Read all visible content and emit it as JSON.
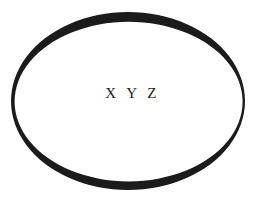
{
  "canvas": {
    "width": 261,
    "height": 207,
    "background_color": "#ffffff"
  },
  "diagram": {
    "shape": {
      "kind": "ellipse",
      "label": "X Y Z",
      "stroke_color": "#1b1b1b",
      "fill_color": "#ffffff",
      "center_x": 128,
      "center_y": 101,
      "radius_x": 117,
      "radius_y": 89,
      "stroke_width_max": 10,
      "stroke_width_min": 3,
      "style": "hand-drawn-variable-width"
    }
  }
}
